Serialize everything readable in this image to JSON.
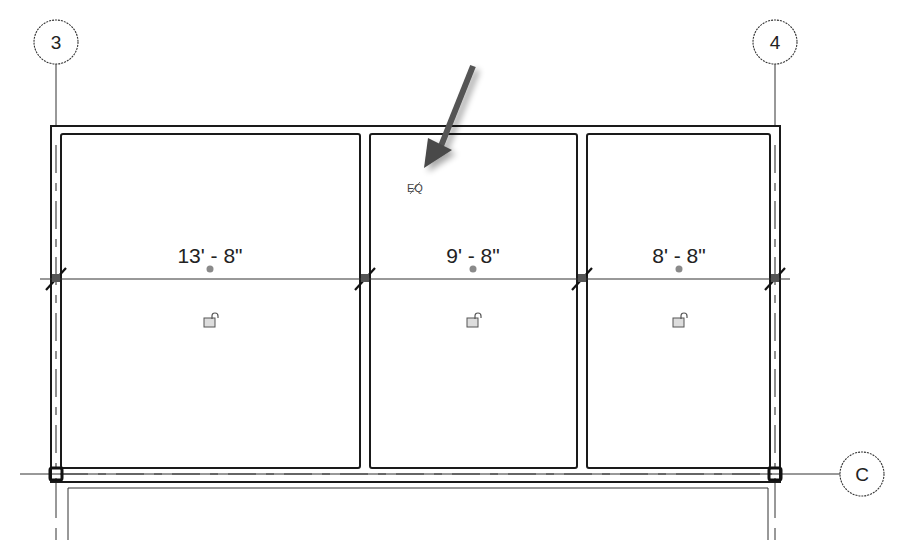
{
  "drawing": {
    "type": "floor-plan-dimension-equality",
    "grid_lines": [
      {
        "label": "3",
        "orientation": "vertical",
        "bubble_x": 56,
        "bubble_y": 42
      },
      {
        "label": "4",
        "orientation": "vertical",
        "bubble_x": 775,
        "bubble_y": 42
      },
      {
        "label": "C",
        "orientation": "horizontal",
        "bubble_x": 862,
        "bubble_y": 474
      }
    ],
    "dimension_string": {
      "segments": [
        {
          "value": "13' - 8\"",
          "x": 210
        },
        {
          "value": "9' - 8\"",
          "x": 473
        },
        {
          "value": "8' - 8\"",
          "x": 679
        }
      ],
      "equality_label": "EQ"
    },
    "annotation": {
      "arrow_pointing_to": "EQ"
    },
    "colors": {
      "line": "#1a1a1a",
      "arrow": "#555555",
      "dot": "#8a8a8a"
    }
  }
}
